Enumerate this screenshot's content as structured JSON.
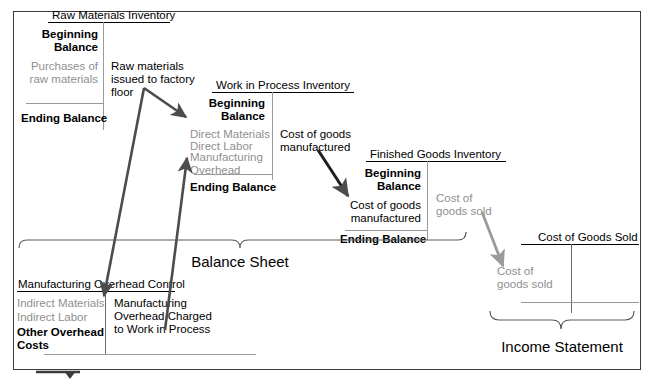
{
  "diagram": {
    "frame_label_balance_sheet": "Balance Sheet",
    "frame_label_income_statement": "Income Statement"
  },
  "accounts": {
    "raw_materials": {
      "title": "Raw Materials Inventory",
      "debit_beginning": "Beginning\nBalance",
      "debit_entry": "Purchases of\nraw materials",
      "debit_ending": "Ending Balance"
    },
    "work_in_process": {
      "title": "Work in Process Inventory",
      "debit_beginning": "Beginning\nBalance",
      "debit_entry_1": "Direct Materials",
      "debit_entry_2": "Direct Labor",
      "debit_entry_3": "Manufacturing\nOverhead",
      "debit_ending": "Ending Balance",
      "credit_entry": "Cost of goods\nmanufactured"
    },
    "finished_goods": {
      "title": "Finished Goods Inventory",
      "debit_beginning": "Beginning\nBalance",
      "debit_entry": "Cost of goods\nmanufactured",
      "debit_ending": "Ending Balance",
      "credit_entry": "Cost of\ngoods sold"
    },
    "cost_of_goods_sold": {
      "title": "Cost of Goods Sold",
      "debit_entry": "Cost of\ngoods sold"
    },
    "manufacturing_overhead_control": {
      "title": "Manufacturing Overhead Control",
      "debit_entry_1": "Indirect Materials",
      "debit_entry_2": "Indirect Labor",
      "debit_entry_3": "Other Overhead\nCosts",
      "credit_entry": "Manufacturing\nOverhead Charged\nto Work in Process"
    }
  },
  "flow_labels": {
    "raw_materials_issued": "Raw materials\nissued to factory\nfloor"
  },
  "colors": {
    "text_primary": "#000000",
    "text_secondary": "#8f8f8f",
    "arrow_dark": "#4c4c4c",
    "arrow_gray": "#9a9a9a",
    "rule": "#000000",
    "rule_light": "#9a9a9a",
    "frame": "#3b3b3b",
    "background": "#ffffff"
  }
}
